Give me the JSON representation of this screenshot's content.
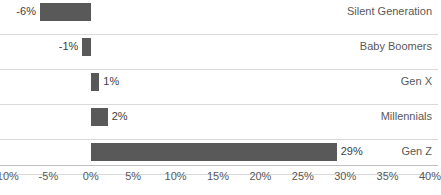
{
  "chart_data": {
    "type": "bar",
    "orientation": "horizontal",
    "title": "",
    "subtitle": "",
    "xlabel": "",
    "ylabel": "",
    "categories": [
      "Silent Generation",
      "Baby Boomers",
      "Gen X",
      "Millennials",
      "Gen Z"
    ],
    "values": [
      -6,
      -1,
      1,
      2,
      29
    ],
    "data_labels": [
      "-6%",
      "-1%",
      "1%",
      "2%",
      "29%"
    ],
    "xlim": [
      -10,
      40
    ],
    "xticks": [
      -10,
      -5,
      0,
      5,
      10,
      15,
      20,
      25,
      30,
      35,
      40
    ],
    "xtick_labels": [
      "-10%",
      "-5%",
      "0%",
      "5%",
      "10%",
      "15%",
      "20%",
      "25%",
      "30%",
      "35%",
      "40%"
    ],
    "grid": "horizontal-row-lines",
    "legend": "none",
    "colors": {
      "bar": "#595959",
      "grid_line": "#d9d9d9",
      "axis_line": "#bfbfbf",
      "tick_text": "#595959",
      "data_label_text": "#404040",
      "category_label_text": "#595959",
      "background": "#ffffff"
    }
  }
}
